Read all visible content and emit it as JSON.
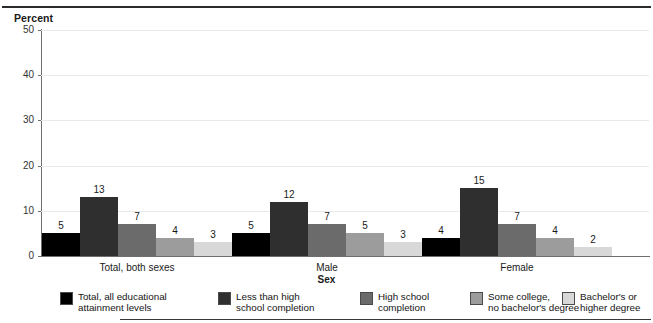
{
  "figure": {
    "cropped_header_text": "",
    "y_axis_title": "Percent",
    "x_axis_title": "Sex"
  },
  "chart_data": {
    "type": "bar",
    "title": "",
    "xlabel": "Sex",
    "ylabel": "Percent",
    "ylim": [
      0,
      50
    ],
    "yticks": [
      0,
      10,
      20,
      30,
      40,
      50
    ],
    "grid": true,
    "legend_position": "bottom",
    "categories": [
      "Total, both sexes",
      "Male",
      "Female"
    ],
    "series": [
      {
        "name": "Total, all educational attainment levels",
        "color": "#000000",
        "values": [
          5,
          5,
          4
        ]
      },
      {
        "name": "Less than high school completion",
        "color": "#2f2f2f",
        "values": [
          13,
          12,
          15
        ]
      },
      {
        "name": "High school completion",
        "color": "#6b6b6b",
        "values": [
          7,
          7,
          7
        ]
      },
      {
        "name": "Some college, no bachelor's degree",
        "color": "#9c9c9c",
        "values": [
          4,
          5,
          4
        ]
      },
      {
        "name": "Bachelor's or higher degree",
        "color": "#d8d8d8",
        "values": [
          3,
          3,
          2
        ]
      }
    ]
  },
  "legend": {
    "items": [
      {
        "label": "Total, all educational\nattainment levels",
        "color": "#000000"
      },
      {
        "label": "Less than high\nschool completion",
        "color": "#2f2f2f"
      },
      {
        "label": "High school\ncompletion",
        "color": "#6b6b6b"
      },
      {
        "label": "Some college,\nno bachelor's degree",
        "color": "#9c9c9c"
      },
      {
        "label": "Bachelor's or\nhigher degree",
        "color": "#d8d8d8"
      }
    ]
  }
}
